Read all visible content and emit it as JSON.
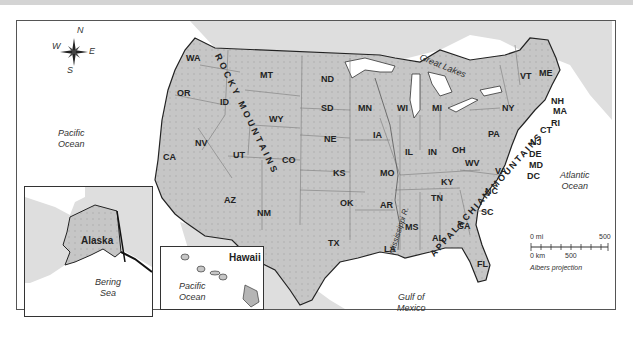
{
  "map": {
    "title": "United States",
    "projection_label": "Albers projection",
    "colors": {
      "land": "#c9c9c9",
      "land_relief": "#b5b5b5",
      "water": "#ffffff",
      "border": "#777777",
      "coast": "#222222",
      "neighbor_land": "#dcdcdc"
    },
    "compass": {
      "n": "N",
      "s": "S",
      "e": "E",
      "w": "W"
    },
    "states": [
      {
        "abbr": "WA"
      },
      {
        "abbr": "OR"
      },
      {
        "abbr": "CA"
      },
      {
        "abbr": "NV"
      },
      {
        "abbr": "ID"
      },
      {
        "abbr": "MT"
      },
      {
        "abbr": "WY"
      },
      {
        "abbr": "UT"
      },
      {
        "abbr": "CO"
      },
      {
        "abbr": "AZ"
      },
      {
        "abbr": "NM"
      },
      {
        "abbr": "ND"
      },
      {
        "abbr": "SD"
      },
      {
        "abbr": "NE"
      },
      {
        "abbr": "KS"
      },
      {
        "abbr": "OK"
      },
      {
        "abbr": "TX"
      },
      {
        "abbr": "MN"
      },
      {
        "abbr": "IA"
      },
      {
        "abbr": "MO"
      },
      {
        "abbr": "AR"
      },
      {
        "abbr": "LA"
      },
      {
        "abbr": "WI"
      },
      {
        "abbr": "IL"
      },
      {
        "abbr": "MI"
      },
      {
        "abbr": "IN"
      },
      {
        "abbr": "OH"
      },
      {
        "abbr": "KY"
      },
      {
        "abbr": "TN"
      },
      {
        "abbr": "MS"
      },
      {
        "abbr": "AL"
      },
      {
        "abbr": "GA"
      },
      {
        "abbr": "FL"
      },
      {
        "abbr": "SC"
      },
      {
        "abbr": "NC"
      },
      {
        "abbr": "VA"
      },
      {
        "abbr": "WV"
      },
      {
        "abbr": "PA"
      },
      {
        "abbr": "NY"
      },
      {
        "abbr": "VT"
      },
      {
        "abbr": "ME"
      },
      {
        "abbr": "NH"
      },
      {
        "abbr": "MA"
      },
      {
        "abbr": "RI"
      },
      {
        "abbr": "CT"
      },
      {
        "abbr": "NJ"
      },
      {
        "abbr": "DE"
      },
      {
        "abbr": "MD"
      },
      {
        "abbr": "DC"
      }
    ],
    "water_bodies": {
      "pacific_main": [
        "Pacific",
        "Ocean"
      ],
      "atlantic": [
        "Atlantic",
        "Ocean"
      ],
      "gulf": [
        "Gulf of",
        "Mexico"
      ],
      "great_lakes": "Great Lakes",
      "bering": [
        "Bering",
        "Sea"
      ],
      "pacific_hawaii": [
        "Pacific",
        "Ocean"
      ]
    },
    "features": {
      "rocky_mountains": "ROCKY MOUNTAINS",
      "appalachian_mountains": "APPALACHIAN MOUNTAINS",
      "mississippi": "Mississippi R."
    },
    "insets": {
      "alaska": "Alaska",
      "hawaii": "Hawaii"
    },
    "scale": {
      "mi_start": "0 mi",
      "mi_end": "500",
      "km_start": "0 km",
      "km_end": "500"
    }
  }
}
